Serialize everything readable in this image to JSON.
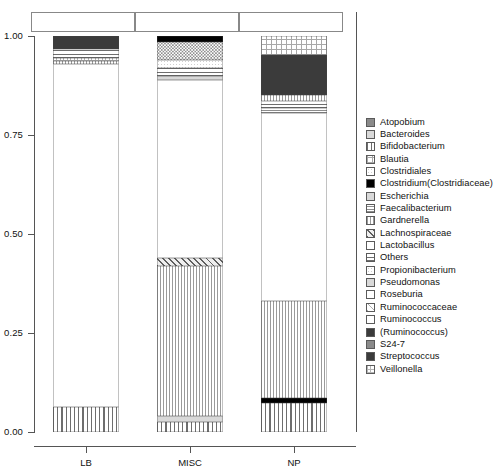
{
  "chart_data": {
    "type": "bar",
    "subtype": "stacked-relative-abundance",
    "title": "",
    "xlabel": "",
    "ylabel": "",
    "ylim": [
      0,
      1
    ],
    "ytick_labels": [
      "0.00",
      "0.25",
      "0.50",
      "0.75",
      "1.00"
    ],
    "ytick_values": [
      0,
      0.25,
      0.5,
      0.75,
      1
    ],
    "grid": false,
    "legend_position": "right",
    "categories": [
      "LB",
      "MISC",
      "NP"
    ],
    "legend_title": "",
    "series": [
      {
        "name": "Atopobium",
        "pattern": "solid-mid",
        "values": [
          0.0,
          0.0,
          0.0
        ]
      },
      {
        "name": "Bacteroides",
        "pattern": "grey-light",
        "values": [
          0.0,
          0.005,
          0.004
        ]
      },
      {
        "name": "Bifidobacterium",
        "pattern": "vline",
        "values": [
          0.063,
          0.013,
          0.068
        ]
      },
      {
        "name": "Blautia",
        "pattern": "grid",
        "values": [
          0.0,
          0.005,
          0.004
        ]
      },
      {
        "name": "Clostridiales",
        "pattern": "stipple",
        "values": [
          0.0,
          0.01,
          0.006
        ]
      },
      {
        "name": "Clostridium(Clostridiaceae)",
        "pattern": "solid-black",
        "values": [
          0.0,
          0.0,
          0.008
        ]
      },
      {
        "name": "Escherichia",
        "pattern": "grey-light",
        "values": [
          0.004,
          0.006,
          0.006
        ]
      },
      {
        "name": "Faecalibacterium",
        "pattern": "hline-fine",
        "values": [
          0.004,
          0.005,
          0.004
        ]
      },
      {
        "name": "Gardnerella",
        "pattern": "vline-fine",
        "values": [
          0.003,
          0.004,
          0.003
        ]
      },
      {
        "name": "Lachnospiraceae",
        "pattern": "diag",
        "values": [
          0.0,
          0.022,
          0.0
        ]
      },
      {
        "name": "Lactobacillus",
        "pattern": "dot",
        "values": [
          0.845,
          0.0,
          0.0
        ]
      },
      {
        "name": "Others",
        "pattern": "hline",
        "values": [
          0.012,
          0.014,
          0.012
        ]
      },
      {
        "name": "Propionibacterium",
        "pattern": "stipple",
        "values": [
          0.0,
          0.005,
          0.004
        ]
      },
      {
        "name": "Pseudomonas",
        "pattern": "grey-light",
        "values": [
          0.0,
          0.004,
          0.003
        ]
      },
      {
        "name": "Roseburia",
        "pattern": "white",
        "values": [
          0.0,
          0.004,
          0.003
        ]
      },
      {
        "name": "Ruminococcaceae",
        "pattern": "diag-light",
        "values": [
          0.0,
          0.366,
          0.219
        ]
      },
      {
        "name": "Ruminococcus",
        "pattern": "dot-sparse",
        "values": [
          0.0,
          0.0,
          0.0
        ]
      },
      {
        "name": "(Ruminococcus)",
        "pattern": "solid-dark",
        "values": [
          0.0,
          0.0,
          0.0
        ]
      },
      {
        "name": "S24-7",
        "pattern": "solid-mid",
        "values": [
          0.0,
          0.0,
          0.0
        ]
      },
      {
        "name": "Streptococcus",
        "pattern": "solid-dark",
        "values": [
          0.034,
          0.0,
          0.098
        ]
      },
      {
        "name": "Veillonella",
        "pattern": "grid-fine",
        "values": [
          0.035,
          0.537,
          0.558
        ]
      }
    ]
  },
  "axis": {
    "y_ticks": [
      {
        "label": "1.00",
        "value": 1.0
      },
      {
        "label": "0.75",
        "value": 0.75
      },
      {
        "label": "0.50",
        "value": 0.5
      },
      {
        "label": "0.25",
        "value": 0.25
      },
      {
        "label": "0.00",
        "value": 0.0
      }
    ],
    "x_ticks": [
      {
        "label": "LB"
      },
      {
        "label": "MISC"
      },
      {
        "label": "NP"
      }
    ]
  },
  "bars": {
    "LB": {
      "label": "LB",
      "segments": [
        {
          "name": "Streptococcus",
          "pattern": "solid-dark",
          "from": 0.966,
          "to": 1.0
        },
        {
          "name": "Others",
          "pattern": "hline",
          "from": 0.944,
          "to": 0.966
        },
        {
          "name": "Veillonella",
          "pattern": "grid-fine",
          "from": 0.937,
          "to": 0.944
        },
        {
          "name": "Gardnerella",
          "pattern": "vline-fine",
          "from": 0.93,
          "to": 0.937
        },
        {
          "name": "Lactobacillus",
          "pattern": "dot",
          "from": 0.063,
          "to": 0.93
        },
        {
          "name": "Bifidobacterium",
          "pattern": "vline",
          "from": 0.0,
          "to": 0.063
        }
      ]
    },
    "MISC": {
      "label": "MISC",
      "segments": [
        {
          "name": "Veillonella",
          "pattern": "solid-black",
          "from": 0.986,
          "to": 1.0
        },
        {
          "name": "Ruminococcus",
          "pattern": "dot-dense",
          "from": 0.94,
          "to": 0.986
        },
        {
          "name": "Clostridiales",
          "pattern": "stipple",
          "from": 0.918,
          "to": 0.94
        },
        {
          "name": "Others",
          "pattern": "hline",
          "from": 0.9,
          "to": 0.918
        },
        {
          "name": "Propionibacterium",
          "pattern": "grey-light",
          "from": 0.888,
          "to": 0.9
        },
        {
          "name": "Ruminococcaceae",
          "pattern": "dot-sparse",
          "from": 0.44,
          "to": 0.888
        },
        {
          "name": "Lachnospiraceae",
          "pattern": "diag",
          "from": 0.418,
          "to": 0.44
        },
        {
          "name": "Veillonella",
          "pattern": "vline-fine",
          "from": 0.04,
          "to": 0.418
        },
        {
          "name": "Bacteroides",
          "pattern": "grey-light",
          "from": 0.026,
          "to": 0.04
        },
        {
          "name": "Bifidobacterium",
          "pattern": "vline",
          "from": 0.0,
          "to": 0.026
        }
      ]
    },
    "NP": {
      "label": "NP",
      "segments": [
        {
          "name": "Veillonella",
          "pattern": "grid",
          "from": 0.952,
          "to": 1.0
        },
        {
          "name": "Streptococcus",
          "pattern": "solid-dark",
          "from": 0.852,
          "to": 0.952
        },
        {
          "name": "Gardnerella",
          "pattern": "vline-fine",
          "from": 0.836,
          "to": 0.852
        },
        {
          "name": "Others",
          "pattern": "hline",
          "from": 0.818,
          "to": 0.836
        },
        {
          "name": "Faecalibacterium",
          "pattern": "hline-fine",
          "from": 0.806,
          "to": 0.818
        },
        {
          "name": "Ruminococcaceae",
          "pattern": "dot",
          "from": 0.33,
          "to": 0.806
        },
        {
          "name": "Blautia",
          "pattern": "vline-fine",
          "from": 0.085,
          "to": 0.33
        },
        {
          "name": "Clostridium",
          "pattern": "solid-black",
          "from": 0.072,
          "to": 0.085
        },
        {
          "name": "Bifidobacterium",
          "pattern": "vline",
          "from": 0.0,
          "to": 0.072
        }
      ]
    }
  },
  "legend": {
    "items": [
      {
        "label": "Atopobium",
        "pattern": "solid-mid"
      },
      {
        "label": "Bacteroides",
        "pattern": "grey-light"
      },
      {
        "label": "Bifidobacterium",
        "pattern": "vline"
      },
      {
        "label": "Blautia",
        "pattern": "grid"
      },
      {
        "label": "Clostridiales",
        "pattern": "stipple"
      },
      {
        "label": "Clostridium(Clostridiaceae)",
        "pattern": "solid-black"
      },
      {
        "label": "Escherichia",
        "pattern": "grey-light"
      },
      {
        "label": "Faecalibacterium",
        "pattern": "hline-fine"
      },
      {
        "label": "Gardnerella",
        "pattern": "vline-fine"
      },
      {
        "label": "Lachnospiraceae",
        "pattern": "diag"
      },
      {
        "label": "Lactobacillus",
        "pattern": "dot"
      },
      {
        "label": "Others",
        "pattern": "hline"
      },
      {
        "label": "Propionibacterium",
        "pattern": "stipple"
      },
      {
        "label": "Pseudomonas",
        "pattern": "grey-light"
      },
      {
        "label": "Roseburia",
        "pattern": "white"
      },
      {
        "label": "Ruminococcaceae",
        "pattern": "diag-light"
      },
      {
        "label": "Ruminococcus",
        "pattern": "dot-sparse"
      },
      {
        "label": "(Ruminococcus)",
        "pattern": "solid-dark"
      },
      {
        "label": "S24-7",
        "pattern": "solid-mid"
      },
      {
        "label": "Streptococcus",
        "pattern": "solid-dark"
      },
      {
        "label": "Veillonella",
        "pattern": "grid-fine"
      }
    ]
  },
  "colors": {
    "axis": "#555555",
    "frame": "#888888",
    "text": "#111111",
    "dark_fill": "#3b3b3b",
    "black_fill": "#000000",
    "background": "#ffffff"
  }
}
